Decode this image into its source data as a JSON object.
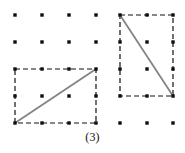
{
  "figure": {
    "caption": "(3)",
    "caption_y": 130,
    "canvas": {
      "width": 185,
      "height": 153,
      "background": "#ffffff"
    },
    "colors": {
      "dot": "#0d0d0d",
      "rectangle_stroke": "#111111",
      "diagonal_stroke": "#848484",
      "background": "#ffffff"
    },
    "grid": {
      "description": "dot lattice",
      "x_positions": [
        15,
        42,
        69,
        96,
        120,
        147,
        173
      ],
      "y_positions": [
        15,
        42,
        69,
        96,
        123
      ],
      "dot_size": 3.4,
      "dot_shape": "square",
      "dots": [
        {
          "x": 15,
          "y": 15
        },
        {
          "x": 42,
          "y": 15
        },
        {
          "x": 69,
          "y": 15
        },
        {
          "x": 96,
          "y": 15
        },
        {
          "x": 120,
          "y": 15
        },
        {
          "x": 147,
          "y": 15
        },
        {
          "x": 173,
          "y": 15
        },
        {
          "x": 15,
          "y": 42
        },
        {
          "x": 42,
          "y": 42
        },
        {
          "x": 69,
          "y": 42
        },
        {
          "x": 96,
          "y": 42
        },
        {
          "x": 120,
          "y": 42
        },
        {
          "x": 147,
          "y": 42
        },
        {
          "x": 173,
          "y": 42
        },
        {
          "x": 15,
          "y": 69
        },
        {
          "x": 42,
          "y": 69
        },
        {
          "x": 69,
          "y": 69
        },
        {
          "x": 96,
          "y": 69
        },
        {
          "x": 120,
          "y": 69
        },
        {
          "x": 147,
          "y": 69
        },
        {
          "x": 173,
          "y": 69
        },
        {
          "x": 15,
          "y": 96
        },
        {
          "x": 42,
          "y": 96
        },
        {
          "x": 69,
          "y": 96
        },
        {
          "x": 96,
          "y": 96
        },
        {
          "x": 120,
          "y": 96
        },
        {
          "x": 147,
          "y": 96
        },
        {
          "x": 173,
          "y": 96
        },
        {
          "x": 15,
          "y": 123
        },
        {
          "x": 42,
          "y": 123
        },
        {
          "x": 69,
          "y": 123
        },
        {
          "x": 96,
          "y": 123
        },
        {
          "x": 120,
          "y": 123
        },
        {
          "x": 147,
          "y": 123
        },
        {
          "x": 173,
          "y": 123
        }
      ]
    },
    "shapes": [
      {
        "name": "left-rectangle",
        "label": "wide rectangle, 3 columns by 2 rows",
        "x": 15,
        "y": 69,
        "width": 81,
        "height": 54,
        "stroke": "#111111",
        "stroke_width": 1.2,
        "dash": "5,3",
        "fill": "none",
        "diagonal": {
          "name": "left-diagonal",
          "x1": 15,
          "y1": 123,
          "x2": 96,
          "y2": 69,
          "stroke": "#848484",
          "stroke_width": 1.8,
          "direction": "bottom-left to top-right"
        }
      },
      {
        "name": "right-rectangle",
        "label": "tall rectangle, 2 columns by 3 rows",
        "x": 120,
        "y": 15,
        "width": 53,
        "height": 81,
        "stroke": "#111111",
        "stroke_width": 1.2,
        "dash": "5,3",
        "fill": "none",
        "diagonal": {
          "name": "right-diagonal",
          "x1": 120,
          "y1": 15,
          "x2": 173,
          "y2": 96,
          "stroke": "#848484",
          "stroke_width": 1.8,
          "direction": "top-left to bottom-right"
        }
      }
    ]
  }
}
